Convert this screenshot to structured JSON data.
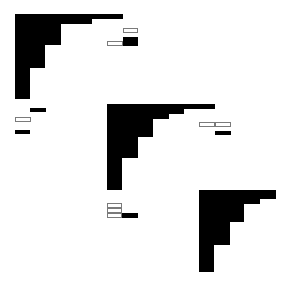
{
  "canvas": {
    "width": 288,
    "height": 286,
    "background": "#ffffff",
    "fill": "#000000",
    "outline": "#7a7a7a"
  },
  "staircases": [
    {
      "name": "staircase-1",
      "rects": [
        [
          15,
          14,
          108,
          5
        ],
        [
          15,
          19,
          77,
          5
        ],
        [
          15,
          24,
          46,
          21
        ],
        [
          15,
          45,
          30,
          23
        ],
        [
          15,
          68,
          15,
          31
        ]
      ]
    },
    {
      "name": "staircase-2",
      "rects": [
        [
          107,
          104,
          108,
          5
        ],
        [
          107,
          109,
          77,
          5
        ],
        [
          107,
          114,
          62,
          5
        ],
        [
          107,
          119,
          46,
          18
        ],
        [
          107,
          137,
          31,
          21
        ],
        [
          107,
          158,
          15,
          32
        ]
      ]
    },
    {
      "name": "staircase-3",
      "rects": [
        [
          199,
          190,
          77,
          9
        ],
        [
          199,
          199,
          61,
          5
        ],
        [
          199,
          204,
          45,
          18
        ],
        [
          199,
          222,
          31,
          23
        ],
        [
          199,
          245,
          15,
          27
        ]
      ]
    }
  ],
  "small_marks": {
    "filled": [
      [
        30,
        108,
        16,
        4
      ],
      [
        15,
        130,
        15,
        4
      ],
      [
        123,
        37,
        15,
        9
      ],
      [
        215,
        131,
        16,
        4
      ],
      [
        122,
        213,
        16,
        5
      ]
    ],
    "outlined": [
      [
        123,
        28,
        15,
        5
      ],
      [
        107,
        41,
        16,
        5
      ],
      [
        15,
        117,
        16,
        5
      ],
      [
        199,
        122,
        16,
        5
      ],
      [
        215,
        122,
        16,
        5
      ],
      [
        107,
        203,
        15,
        5
      ],
      [
        107,
        208,
        15,
        5
      ],
      [
        107,
        213,
        15,
        5
      ]
    ]
  }
}
